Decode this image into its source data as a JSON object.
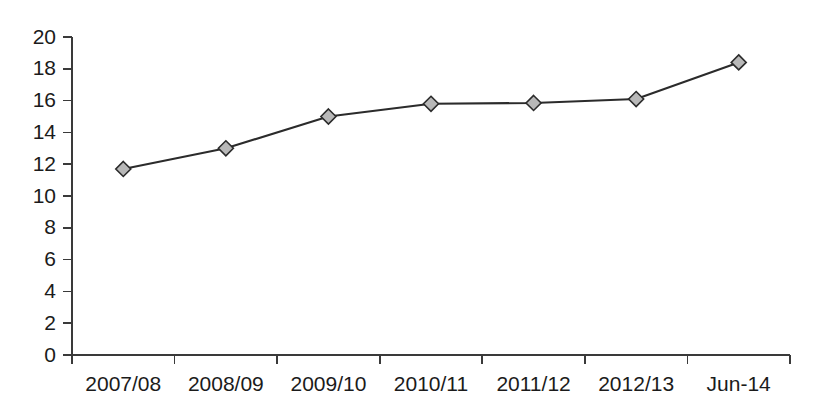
{
  "chart_data": {
    "type": "line",
    "title": "",
    "subtitle": "",
    "xlabel": "",
    "ylabel": "",
    "categories": [
      "2007/08",
      "2008/09",
      "2009/10",
      "2010/11",
      "2011/12",
      "2012/13",
      "Jun-14"
    ],
    "values": [
      11.7,
      13.0,
      15.0,
      15.8,
      15.85,
      16.1,
      18.4
    ],
    "series": [
      {
        "name": "",
        "values": [
          11.7,
          13.0,
          15.0,
          15.8,
          15.85,
          16.1,
          18.4
        ]
      }
    ],
    "ylim": [
      0,
      20
    ],
    "ytick_values": [
      0,
      2,
      4,
      6,
      8,
      10,
      12,
      14,
      16,
      18,
      20
    ],
    "ytick_labels": [
      "0",
      "2",
      "4",
      "6",
      "8",
      "10",
      "12",
      "14",
      "16",
      "18",
      "20"
    ],
    "grid": false,
    "legend": false,
    "legend_position": "none",
    "marker_shape": "diamond",
    "colors": {
      "line": "#2b2b2b",
      "marker_fill": "#b8b8b8",
      "marker_stroke": "#2b2b2b",
      "axis": "#3a3a3a",
      "text": "#1b1b1b",
      "background": "#ffffff"
    }
  }
}
